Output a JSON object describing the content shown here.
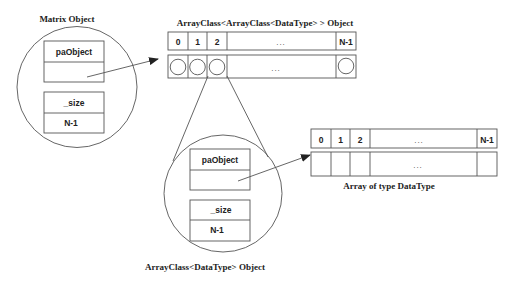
{
  "diagram": {
    "matrix_object": {
      "title": "Matrix Object",
      "fields": [
        {
          "name": "paObject",
          "value": ""
        },
        {
          "name": "_size",
          "value": "N-1"
        }
      ]
    },
    "outer_array": {
      "title": "ArrayClass<ArrayClass<DataType> > Object",
      "indices": [
        "0",
        "1",
        "2",
        "...",
        "N-1"
      ],
      "row_dots": "..."
    },
    "inner_object": {
      "title": "ArrayClass<DataType> Object",
      "fields": [
        {
          "name": "paObject",
          "value": ""
        },
        {
          "name": "_size",
          "value": "N-1"
        }
      ]
    },
    "data_array": {
      "title": "Array of type DataType",
      "indices": [
        "0",
        "1",
        "2",
        "...",
        "N-1"
      ],
      "row_dots": "..."
    },
    "colors": {
      "line": "#555555",
      "text": "#222222",
      "background": "#ffffff"
    }
  }
}
